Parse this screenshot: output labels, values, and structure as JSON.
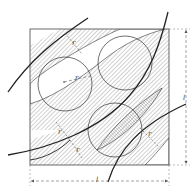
{
  "diagram": {
    "type": "geometric-technical-drawing",
    "colors": {
      "line": "#333333",
      "hatch": "#9a9a9a",
      "background": "#ffffff",
      "dimension": "#666666"
    },
    "labels": {
      "side_bottom": "l",
      "side_right": "l",
      "radius_circle": "r",
      "band_width_top": "r",
      "band_width_left": "r",
      "band_width_left_lower": "r",
      "band_width_right": "r"
    },
    "square": {
      "x": 30,
      "y": 29,
      "size": 139
    },
    "circles": [
      {
        "name": "upper-left",
        "cx": 65,
        "cy": 84,
        "r": 27
      },
      {
        "name": "upper-right",
        "cx": 125,
        "cy": 63,
        "r": 27
      },
      {
        "name": "lower-center",
        "cx": 115,
        "cy": 130,
        "r": 27
      }
    ]
  }
}
